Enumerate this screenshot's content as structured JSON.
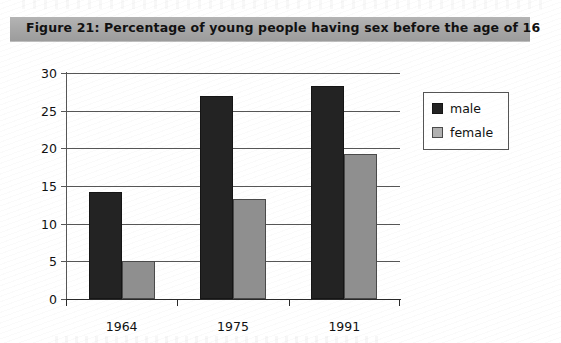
{
  "figure": {
    "title": "Figure 21:  Percentage of young people having sex before the age of 16"
  },
  "legend": {
    "items": [
      {
        "label": "male",
        "color": "#232323"
      },
      {
        "label": "female",
        "color": "#8f8f8f"
      }
    ]
  },
  "chart_data": {
    "type": "bar",
    "title": "Figure 21:  Percentage of young people having sex before the age of 16",
    "xlabel": "",
    "ylabel": "percentage",
    "categories": [
      "1964",
      "1975",
      "1991"
    ],
    "series": [
      {
        "name": "male",
        "color": "#232323",
        "values": [
          14.2,
          27.0,
          28.3
        ]
      },
      {
        "name": "female",
        "color": "#8f8f8f",
        "values": [
          5.0,
          13.3,
          19.2
        ]
      }
    ],
    "ylim": [
      0,
      30
    ],
    "yticks": [
      0,
      5,
      10,
      15,
      20,
      25,
      30
    ],
    "ytick_labels": [
      "0",
      "5",
      "10",
      "15",
      "20",
      "25",
      "30"
    ],
    "grid": true,
    "grid_axis": "y",
    "legend_position": "right"
  }
}
